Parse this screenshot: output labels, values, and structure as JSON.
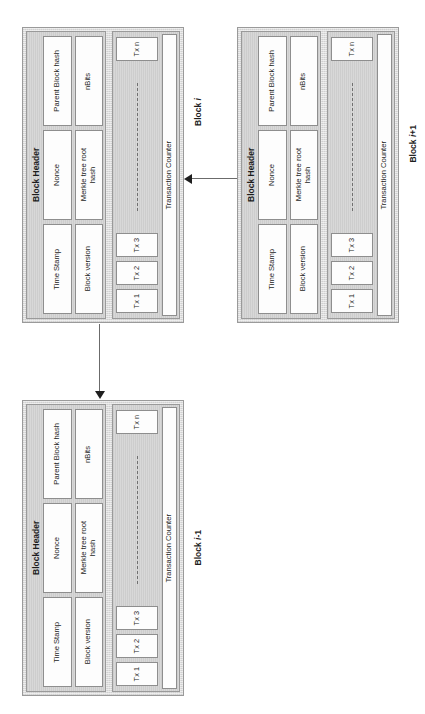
{
  "diagram": {
    "field_labels": {
      "block_version": "Block version",
      "merkle_root": "Merkle tree root\nhash",
      "nbits": "nBits",
      "time_stamp": "Time Stamp",
      "nonce": "Nonce",
      "parent_hash": "Parent Block hash"
    },
    "header_title": "Block Header",
    "transaction_counter": "Transaction Counter",
    "tx_labels": [
      "Tx 1",
      "Tx 2",
      "Tx 3",
      "Tx n"
    ],
    "blocks": [
      {
        "id": "block-i",
        "caption": "Block i",
        "caption_plain": "Block ",
        "caption_italic": "i",
        "header_title": "Block Header",
        "fields_col_left": [
          "Block version",
          "Merkle tree root\nhash",
          "nBits"
        ],
        "fields_col_right": [
          "Time Stamp",
          "Nonce",
          "Parent Block hash"
        ],
        "counter": "Transaction Counter",
        "txs": [
          "Tx 1",
          "Tx 2",
          "Tx 3",
          "Tx n"
        ]
      },
      {
        "id": "block-i-plus-1",
        "caption": "Block i+1",
        "caption_plain": "Block ",
        "caption_italic": "i",
        "caption_suffix": "+1",
        "header_title": "Block Header",
        "fields_col_left": [
          "Block version",
          "Merkle tree root\nhash",
          "nBits"
        ],
        "fields_col_right": [
          "Time Stamp",
          "Nonce",
          "Parent Block hash"
        ],
        "counter": "Transaction Counter",
        "txs": [
          "Tx 1",
          "Tx 2",
          "Tx 3",
          "Tx n"
        ]
      },
      {
        "id": "block-i-minus-1",
        "caption": "Block i-1",
        "caption_plain": "Block ",
        "caption_italic": "i",
        "caption_suffix": "-1",
        "header_title": "Block Header",
        "fields_col_left": [
          "Block version",
          "Merkle tree root\nhash",
          "nBits"
        ],
        "fields_col_right": [
          "Time Stamp",
          "Nonce",
          "Parent Block hash"
        ],
        "counter": "Transaction Counter",
        "txs": [
          "Tx 1",
          "Tx 2",
          "Tx 3",
          "Tx n"
        ]
      }
    ],
    "connectors": [
      {
        "id": "link-iplus1-to-i",
        "from": "Block i+1",
        "to": "Block i",
        "direction": "left"
      },
      {
        "id": "link-i-to-iminus1",
        "from": "Block i",
        "to": "Block i-1",
        "direction": "down"
      }
    ],
    "colors": {
      "block_fill": "#dcdcdc",
      "pane_fill": "#d8d8d8",
      "field_fill": "#fdfdfd",
      "border": "#8e8e8e",
      "text": "#1d1d1d",
      "connector": "#6b6b6b",
      "background": "#ffffff"
    }
  }
}
